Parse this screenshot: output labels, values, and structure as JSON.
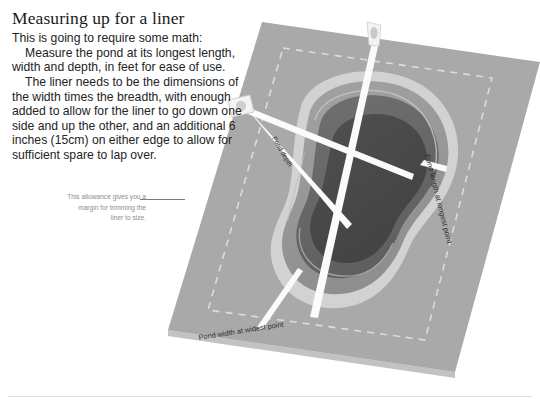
{
  "page": {
    "heading": "Measuring up for a liner",
    "paragraphs": [
      {
        "id": "intro",
        "text": "This is going to require some math:",
        "indented": false
      },
      {
        "id": "measure",
        "text": "Measure the pond at its longest length, width and depth, in feet for ease of use.",
        "indented": true
      },
      {
        "id": "liner-dimensions",
        "text": "The liner needs to be the dimensions of the width times the breadth, with enough added to allow for the liner to go down one side and up the other, and an additional 6 inches (15cm) on either edge to allow for sufficient spare to lap over.",
        "indented": true
      }
    ],
    "caption": {
      "text": "This allowance gives you a margin for trimming the liner to size.",
      "lines": [
        "This allowance gives you a",
        "margin for trimming the",
        "liner to size."
      ]
    }
  },
  "diagram": {
    "labels": {
      "length": "Pond length at longest point",
      "width": "Pond width at widest point",
      "depth": "Pond depth"
    },
    "markers": {
      "top_tape_name": "measuring-tape-top",
      "left_reel_name": "measuring-tape-reel-left",
      "right_tape_name": "measuring-tape-right"
    },
    "colors": {
      "ground": "#a9a9a9",
      "ground_edge": "#8f8f8f",
      "dashed_liner_outline": "#d6d6d6",
      "pond_rim": "#d2d2d2",
      "pond_shelf": "#9a9a9a",
      "pond_mid": "#6d6d6d",
      "pond_deep": "#4c4c4c",
      "tape_white": "#fbfbfb",
      "caption_grey": "#8d8d8d",
      "heading_black": "#1a1a1a",
      "rule_grey": "#dedede"
    }
  }
}
